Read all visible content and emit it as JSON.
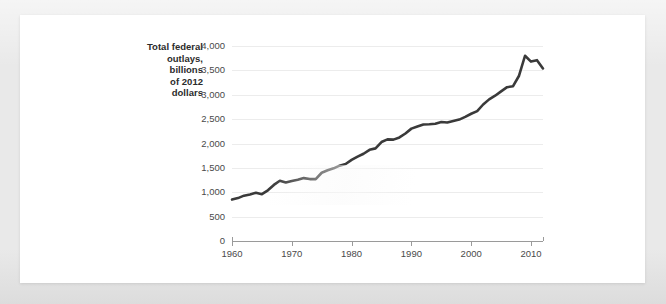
{
  "card": {
    "background_color": "#ffffff",
    "page_background_color": "#e9e9e9"
  },
  "chart_data": {
    "type": "line",
    "title": "",
    "subtitle": "",
    "xlabel": "",
    "ylabel": "Total federal outlays, billions of 2012 dollars",
    "ylabel_lines": [
      "Total federal",
      "outlays,",
      "billions",
      "of 2012",
      "dollars"
    ],
    "line_color": "#3a3a3a",
    "grid": true,
    "grid_color": "#ececec",
    "legend": "none",
    "xlim": [
      1960,
      2012
    ],
    "ylim": [
      0,
      4000
    ],
    "xticks": [
      1960,
      1970,
      1980,
      1990,
      2000,
      2010
    ],
    "xtick_labels": [
      "1960",
      "1970",
      "1980",
      "1990",
      "2000",
      "2010"
    ],
    "yticks": [
      0,
      500,
      1000,
      1500,
      2000,
      2500,
      3000,
      3500,
      4000
    ],
    "ytick_labels": [
      "0",
      "500",
      "1,000",
      "1,500",
      "2,000",
      "2,500",
      "3,000",
      "3,500",
      "4,000"
    ],
    "series": [
      {
        "name": "Total federal outlays",
        "x": [
          1960,
          1961,
          1962,
          1963,
          1964,
          1965,
          1966,
          1967,
          1968,
          1969,
          1970,
          1971,
          1972,
          1973,
          1974,
          1975,
          1976,
          1977,
          1978,
          1979,
          1980,
          1981,
          1982,
          1983,
          1984,
          1985,
          1986,
          1987,
          1988,
          1989,
          1990,
          1991,
          1992,
          1993,
          1994,
          1995,
          1996,
          1997,
          1998,
          1999,
          2000,
          2001,
          2002,
          2003,
          2004,
          2005,
          2006,
          2007,
          2008,
          2009,
          2010,
          2011,
          2012
        ],
        "values": [
          850,
          880,
          930,
          955,
          990,
          960,
          1040,
          1150,
          1235,
          1200,
          1230,
          1255,
          1290,
          1270,
          1270,
          1400,
          1450,
          1490,
          1545,
          1580,
          1665,
          1730,
          1790,
          1870,
          1900,
          2030,
          2085,
          2080,
          2125,
          2205,
          2305,
          2350,
          2390,
          2395,
          2405,
          2440,
          2430,
          2460,
          2490,
          2545,
          2610,
          2665,
          2800,
          2905,
          2980,
          3070,
          3155,
          3175,
          3390,
          3800,
          3680,
          3710,
          3540
        ]
      }
    ],
    "annotations": []
  }
}
